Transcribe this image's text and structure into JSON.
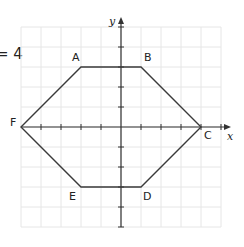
{
  "fragment_text": "= 4",
  "axes": {
    "x_label": "x",
    "y_label": "y",
    "origin_px": [
      121,
      127
    ],
    "unit_px": 20,
    "x_range": [
      -5,
      5
    ],
    "y_range": [
      -5,
      5
    ]
  },
  "colors": {
    "grid": "#e6e6e6",
    "axis": "#333333",
    "shape": "#3a3a3a",
    "label": "#222222"
  },
  "vertices": [
    {
      "label": "A",
      "x": -2,
      "y": 3
    },
    {
      "label": "B",
      "x": 1,
      "y": 3
    },
    {
      "label": "C",
      "x": 4,
      "y": 0
    },
    {
      "label": "D",
      "x": 1,
      "y": -3
    },
    {
      "label": "E",
      "x": -2,
      "y": -3
    },
    {
      "label": "F",
      "x": -5,
      "y": 0
    }
  ]
}
